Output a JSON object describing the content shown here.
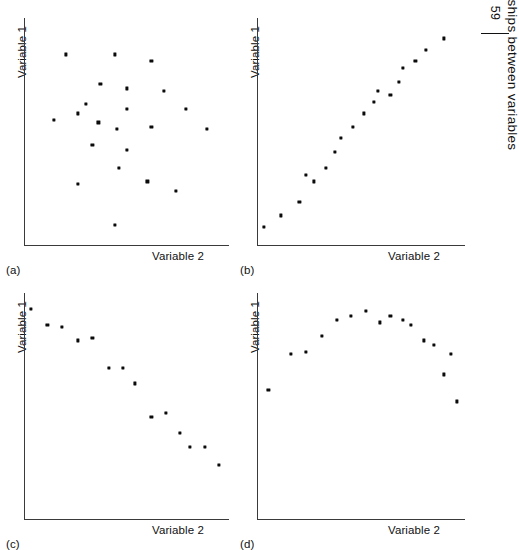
{
  "header": {
    "folio": "59",
    "running_title": "Relationships between variables"
  },
  "figure": {
    "axis_labels": {
      "y": "Variable 1",
      "x": "Variable 2"
    }
  },
  "panels": [
    {
      "id": "a",
      "label": "(a)",
      "ylabel": "Variable 1",
      "xlabel": "Variable 2"
    },
    {
      "id": "b",
      "label": "(b)",
      "ylabel": "Variable 1",
      "xlabel": "Variable 2"
    },
    {
      "id": "c",
      "label": "(c)",
      "ylabel": "Variable 1",
      "xlabel": "Variable 2"
    },
    {
      "id": "d",
      "label": "(d)",
      "ylabel": "Variable 1",
      "xlabel": "Variable 2"
    }
  ],
  "chart_data": [
    {
      "type": "scatter",
      "panel": "a",
      "title": "",
      "xlabel": "Variable 2",
      "ylabel": "Variable 1",
      "xlim": [
        0,
        100
      ],
      "ylim": [
        0,
        100
      ],
      "grid": false,
      "legend": null,
      "relationship": "no relationship / random scatter",
      "marker_color": "#0b0b0b",
      "points": [
        {
          "x": 20,
          "y": 84
        },
        {
          "x": 44,
          "y": 84
        },
        {
          "x": 62,
          "y": 81
        },
        {
          "x": 37,
          "y": 71
        },
        {
          "x": 50,
          "y": 69
        },
        {
          "x": 68,
          "y": 68
        },
        {
          "x": 30,
          "y": 62
        },
        {
          "x": 26,
          "y": 58
        },
        {
          "x": 50,
          "y": 60
        },
        {
          "x": 14,
          "y": 55
        },
        {
          "x": 36,
          "y": 54
        },
        {
          "x": 45,
          "y": 51
        },
        {
          "x": 79,
          "y": 60
        },
        {
          "x": 62,
          "y": 52
        },
        {
          "x": 89,
          "y": 51
        },
        {
          "x": 33,
          "y": 44
        },
        {
          "x": 50,
          "y": 42
        },
        {
          "x": 46,
          "y": 34
        },
        {
          "x": 26,
          "y": 27
        },
        {
          "x": 60,
          "y": 28
        },
        {
          "x": 74,
          "y": 24
        },
        {
          "x": 44,
          "y": 9
        }
      ]
    },
    {
      "type": "scatter",
      "panel": "b",
      "title": "",
      "xlabel": "Variable 2",
      "ylabel": "Variable 1",
      "xlim": [
        0,
        100
      ],
      "ylim": [
        0,
        100
      ],
      "grid": false,
      "legend": null,
      "relationship": "strong positive linear relationship",
      "marker_color": "#0b0b0b",
      "points": [
        {
          "x": 3,
          "y": 8
        },
        {
          "x": 11,
          "y": 13
        },
        {
          "x": 20,
          "y": 19
        },
        {
          "x": 23,
          "y": 31
        },
        {
          "x": 27,
          "y": 28
        },
        {
          "x": 33,
          "y": 34
        },
        {
          "x": 37,
          "y": 41
        },
        {
          "x": 40,
          "y": 47
        },
        {
          "x": 46,
          "y": 52
        },
        {
          "x": 51,
          "y": 58
        },
        {
          "x": 56,
          "y": 63
        },
        {
          "x": 58,
          "y": 68
        },
        {
          "x": 64,
          "y": 66
        },
        {
          "x": 68,
          "y": 72
        },
        {
          "x": 70,
          "y": 78
        },
        {
          "x": 76,
          "y": 81
        },
        {
          "x": 81,
          "y": 86
        },
        {
          "x": 90,
          "y": 91
        }
      ]
    },
    {
      "type": "scatter",
      "panel": "c",
      "title": "",
      "xlabel": "Variable 2",
      "ylabel": "Variable 1",
      "xlim": [
        0,
        100
      ],
      "ylim": [
        0,
        100
      ],
      "grid": false,
      "legend": null,
      "relationship": "strong negative linear relationship",
      "marker_color": "#0b0b0b",
      "points": [
        {
          "x": 3,
          "y": 93
        },
        {
          "x": 11,
          "y": 86
        },
        {
          "x": 18,
          "y": 85
        },
        {
          "x": 26,
          "y": 79
        },
        {
          "x": 33,
          "y": 80
        },
        {
          "x": 41,
          "y": 67
        },
        {
          "x": 48,
          "y": 67
        },
        {
          "x": 54,
          "y": 60
        },
        {
          "x": 62,
          "y": 45
        },
        {
          "x": 69,
          "y": 47
        },
        {
          "x": 76,
          "y": 38
        },
        {
          "x": 81,
          "y": 32
        },
        {
          "x": 88,
          "y": 32
        },
        {
          "x": 95,
          "y": 24
        }
      ]
    },
    {
      "type": "scatter",
      "panel": "d",
      "title": "",
      "xlabel": "Variable 2",
      "ylabel": "Variable 1",
      "xlim": [
        0,
        100
      ],
      "ylim": [
        0,
        100
      ],
      "grid": false,
      "legend": null,
      "relationship": "curvilinear (inverted-U) relationship",
      "marker_color": "#0b0b0b",
      "points": [
        {
          "x": 5,
          "y": 57
        },
        {
          "x": 16,
          "y": 73
        },
        {
          "x": 23,
          "y": 74
        },
        {
          "x": 31,
          "y": 81
        },
        {
          "x": 38,
          "y": 88
        },
        {
          "x": 45,
          "y": 90
        },
        {
          "x": 52,
          "y": 92
        },
        {
          "x": 59,
          "y": 87
        },
        {
          "x": 64,
          "y": 90
        },
        {
          "x": 70,
          "y": 88
        },
        {
          "x": 74,
          "y": 86
        },
        {
          "x": 80,
          "y": 79
        },
        {
          "x": 85,
          "y": 77
        },
        {
          "x": 93,
          "y": 73
        },
        {
          "x": 90,
          "y": 64
        },
        {
          "x": 96,
          "y": 52
        }
      ]
    }
  ]
}
